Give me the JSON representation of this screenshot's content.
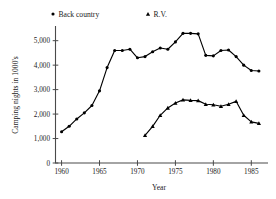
{
  "chart_data": {
    "type": "line",
    "title": "",
    "xlabel": "Year",
    "ylabel": "Camping nights in 1000's",
    "xlim": [
      1959.2,
      1987.2
    ],
    "ylim": [
      0,
      5600
    ],
    "grid": false,
    "legend_position": "top",
    "xticks": [
      1960,
      1965,
      1970,
      1975,
      1980,
      1985
    ],
    "xtick_labels": [
      "1960",
      "1965",
      "1970",
      "1975",
      "1980",
      "1985"
    ],
    "yticks": [
      0,
      1000,
      2000,
      3000,
      4000,
      5000
    ],
    "ytick_labels": [
      "0",
      "1,000",
      "2,000",
      "3,000",
      "4,000",
      "5,000"
    ],
    "series": [
      {
        "name": "Back country",
        "marker": "circle",
        "color": "#000000",
        "x": [
          1960,
          1961,
          1962,
          1963,
          1964,
          1965,
          1966,
          1967,
          1968,
          1969,
          1970,
          1971,
          1972,
          1973,
          1974,
          1975,
          1976,
          1977,
          1978,
          1979,
          1980,
          1981,
          1982,
          1983,
          1984,
          1985,
          1986
        ],
        "values": [
          1280,
          1500,
          1800,
          2050,
          2350,
          2950,
          3900,
          4600,
          4600,
          4650,
          4300,
          4350,
          4550,
          4700,
          4650,
          4950,
          5300,
          5300,
          5280,
          4400,
          4380,
          4600,
          4620,
          4350,
          4000,
          3780,
          3760
        ]
      },
      {
        "name": "R.V.",
        "marker": "triangle",
        "color": "#000000",
        "x": [
          1971,
          1972,
          1973,
          1974,
          1975,
          1976,
          1977,
          1978,
          1979,
          1980,
          1981,
          1982,
          1983,
          1984,
          1985,
          1986
        ],
        "values": [
          1130,
          1500,
          1950,
          2250,
          2450,
          2580,
          2560,
          2550,
          2400,
          2380,
          2320,
          2400,
          2520,
          1950,
          1680,
          1620
        ]
      }
    ]
  },
  "legend": {
    "entries": [
      {
        "label": "Back country",
        "marker": "circle"
      },
      {
        "label": "R.V.",
        "marker": "triangle"
      }
    ]
  }
}
